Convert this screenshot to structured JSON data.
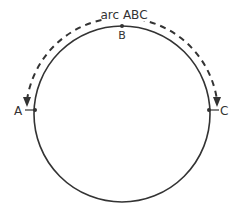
{
  "diagram": {
    "arc_label": "arc ABC",
    "points": [
      {
        "id": "A",
        "label": "A"
      },
      {
        "id": "B",
        "label": "B"
      },
      {
        "id": "C",
        "label": "C"
      }
    ],
    "colors": {
      "stroke": "#333333",
      "background": "#ffffff"
    }
  }
}
